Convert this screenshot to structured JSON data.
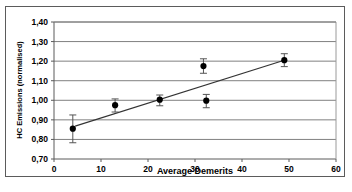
{
  "chart_data": {
    "type": "scatter",
    "title": "",
    "xlabel": "Average Demerits",
    "ylabel": "HC Emissions (normalised)",
    "xlim": [
      0,
      60
    ],
    "ylim": [
      0.7,
      1.4
    ],
    "xticks": [
      "0",
      "10",
      "20",
      "30",
      "40",
      "50",
      "60"
    ],
    "xtick_values": [
      0,
      10,
      20,
      30,
      40,
      50,
      60
    ],
    "yticks": [
      "0,70",
      "0,80",
      "0,90",
      "1,00",
      "1,10",
      "1,20",
      "1,30",
      "1,40"
    ],
    "ytick_values": [
      0.7,
      0.8,
      0.9,
      1.0,
      1.1,
      1.2,
      1.3,
      1.4
    ],
    "grid": "horizontal",
    "legend": "none",
    "marker": "filled-circle",
    "marker_color": "#000000",
    "errorbar_color": "#555555",
    "trendline_color": "#333333",
    "points": [
      {
        "x": 4.0,
        "y": 0.855,
        "yerr_low": 0.783,
        "yerr_high": 0.925
      },
      {
        "x": 13.0,
        "y": 0.975,
        "yerr_low": 0.94,
        "yerr_high": 1.007
      },
      {
        "x": 22.5,
        "y": 1.003,
        "yerr_low": 0.972,
        "yerr_high": 1.027
      },
      {
        "x": 31.8,
        "y": 1.175,
        "yerr_low": 1.138,
        "yerr_high": 1.212
      },
      {
        "x": 32.4,
        "y": 0.998,
        "yerr_low": 0.962,
        "yerr_high": 1.03
      },
      {
        "x": 49.0,
        "y": 1.205,
        "yerr_low": 1.172,
        "yerr_high": 1.238
      }
    ],
    "trendline": {
      "x0": 4.5,
      "y0": 0.868,
      "x1": 49.5,
      "y1": 1.208
    }
  },
  "figure": {
    "xlabel": "Average Demerits",
    "ylabel": "HC Emissions (normalised)"
  }
}
